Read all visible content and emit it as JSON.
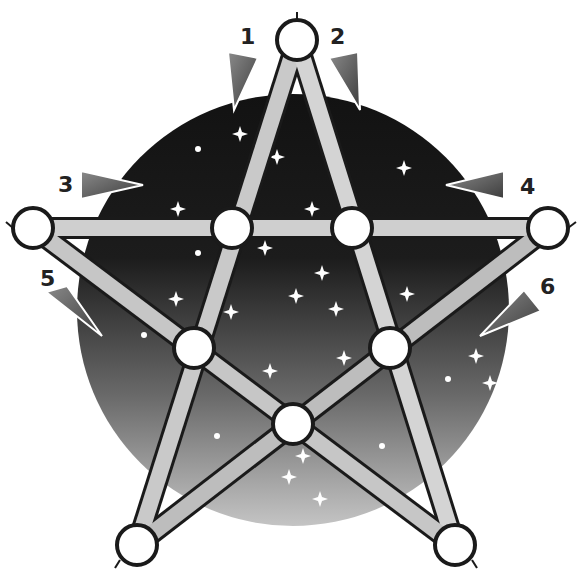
{
  "diagram": {
    "type": "pentagram-puzzle",
    "background_disc": {
      "cx": 293,
      "cy": 310,
      "r": 216,
      "top_color": "#141414",
      "bottom_color": "#bdbdbd"
    },
    "nodes": [
      {
        "id": "top",
        "x": 297,
        "y": 40
      },
      {
        "id": "left-outer",
        "x": 33,
        "y": 228
      },
      {
        "id": "right-outer",
        "x": 548,
        "y": 228
      },
      {
        "id": "inner-top-left",
        "x": 232,
        "y": 228
      },
      {
        "id": "inner-top-right",
        "x": 352,
        "y": 228
      },
      {
        "id": "inner-mid-left",
        "x": 194,
        "y": 348
      },
      {
        "id": "inner-mid-right",
        "x": 390,
        "y": 348
      },
      {
        "id": "inner-bottom",
        "x": 293,
        "y": 424
      },
      {
        "id": "bottom-left",
        "x": 137,
        "y": 545
      },
      {
        "id": "bottom-right",
        "x": 455,
        "y": 545
      }
    ],
    "arrows": [
      {
        "label": "1",
        "label_x": 240,
        "label_y": 26
      },
      {
        "label": "2",
        "label_x": 330,
        "label_y": 26
      },
      {
        "label": "3",
        "label_x": 58,
        "label_y": 176
      },
      {
        "label": "4",
        "label_x": 518,
        "label_y": 176
      },
      {
        "label": "5",
        "label_x": 40,
        "label_y": 270
      },
      {
        "label": "6",
        "label_x": 540,
        "label_y": 276
      }
    ]
  }
}
